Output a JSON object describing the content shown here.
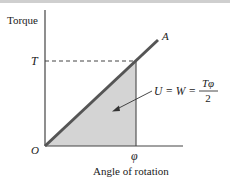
{
  "figure": {
    "y_axis_label": "Torque",
    "x_axis_label": "Angle of rotation",
    "origin_label": "O",
    "torque_level_label": "T",
    "angle_label": "φ",
    "line_end_label": "A",
    "formula": {
      "lhs": "U = W =",
      "numerator": "Tφ",
      "denominator": "2"
    },
    "colors": {
      "axes": "#444444",
      "line": "#555555",
      "shaded_area": "#d4d4d4",
      "dashed": "#444444",
      "text": "#1a1a1a"
    }
  }
}
